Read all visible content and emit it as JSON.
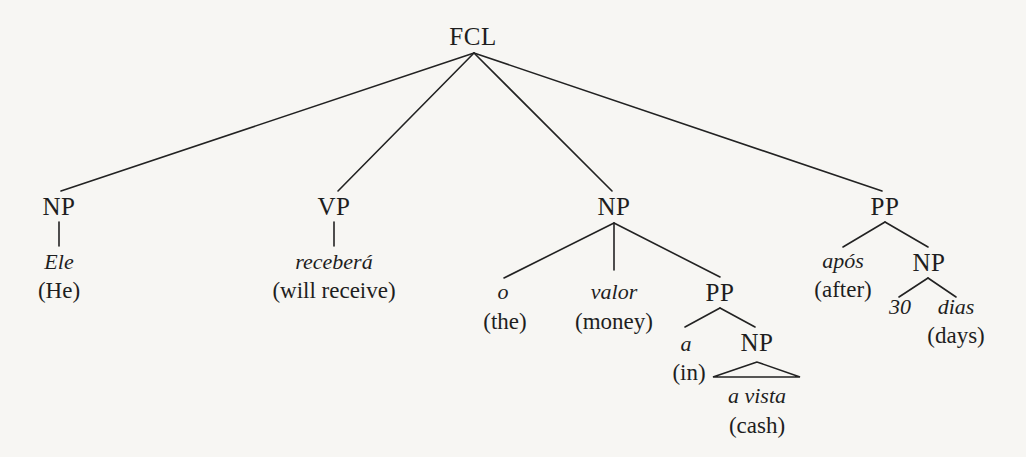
{
  "diagram": {
    "type": "syntax-tree",
    "root": "FCL",
    "nodes": {
      "fcl": {
        "label": "FCL"
      },
      "np_subject": {
        "label": "NP",
        "word": "Ele",
        "gloss": "(He)"
      },
      "vp": {
        "label": "VP",
        "word": "receberá",
        "gloss": "(will receive)"
      },
      "np_object": {
        "label": "NP",
        "children": {
          "det": {
            "word": "o",
            "gloss": "(the)"
          },
          "noun": {
            "word": "valor",
            "gloss": "(money)"
          },
          "pp": {
            "label": "PP",
            "prep": {
              "word": "a",
              "gloss": "(in)"
            },
            "np": {
              "label": "NP",
              "word": "a vista",
              "gloss": "(cash)"
            }
          }
        }
      },
      "pp_time": {
        "label": "PP",
        "prep": {
          "word": "após",
          "gloss": "(after)"
        },
        "np": {
          "label": "NP",
          "num": {
            "word": "30"
          },
          "noun": {
            "word": "dias",
            "gloss": "(days)"
          }
        }
      }
    },
    "line_color": "#222222",
    "text_color": "#1e1e1e",
    "background": "#f7f6f3"
  }
}
